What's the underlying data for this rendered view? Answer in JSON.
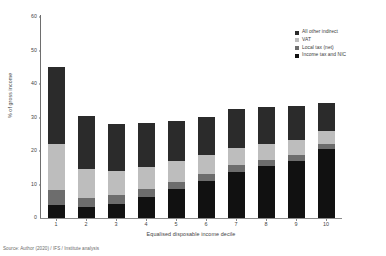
{
  "chart_data": {
    "type": "bar",
    "stacked": true,
    "title": "",
    "xlabel": "Equalised disposable income decile",
    "ylabel": "% of gross income",
    "categories": [
      "1",
      "2",
      "3",
      "4",
      "5",
      "6",
      "7",
      "8",
      "9",
      "10"
    ],
    "ylim": [
      0,
      60
    ],
    "yticks": [
      "0",
      "10",
      "20",
      "30",
      "40",
      "50",
      "60"
    ],
    "grid": false,
    "legend_position": "top-right",
    "series": [
      {
        "name": "Income tax and NIC",
        "color": "#111111",
        "values": [
          4.0,
          3.3,
          4.3,
          6.3,
          8.7,
          11.0,
          13.7,
          15.4,
          17.1,
          20.6
        ]
      },
      {
        "name": "Local tax (net)",
        "color": "#6d6d6d",
        "values": [
          4.5,
          2.7,
          2.5,
          2.4,
          2.2,
          2.2,
          2.1,
          1.9,
          1.7,
          1.4
        ]
      },
      {
        "name": "VAT",
        "color": "#bdbdbd",
        "values": [
          13.5,
          8.5,
          7.3,
          6.6,
          6.0,
          5.5,
          5.1,
          4.8,
          4.5,
          3.9
        ]
      },
      {
        "name": "All other indirect",
        "color": "#2b2b2b",
        "values": [
          23.0,
          16.0,
          14.0,
          13.0,
          12.0,
          11.5,
          11.5,
          10.9,
          10.0,
          8.5
        ]
      }
    ],
    "totals": [
      45.0,
      30.5,
      28.1,
      28.3,
      28.9,
      30.2,
      32.4,
      33.0,
      33.3,
      34.4
    ],
    "annotations": []
  },
  "axis": {
    "y_title": "% of gross income",
    "x_title": "Equalised disposable income decile"
  },
  "legend": {
    "items": [
      {
        "label": "All other indirect",
        "color": "#2b2b2b"
      },
      {
        "label": "VAT",
        "color": "#bdbdbd"
      },
      {
        "label": "Local tax (net)",
        "color": "#6d6d6d"
      },
      {
        "label": "Income tax and NIC",
        "color": "#111111"
      }
    ]
  },
  "footer": {
    "source": "Source: Author (2020) / IFS / Institute analysis"
  }
}
